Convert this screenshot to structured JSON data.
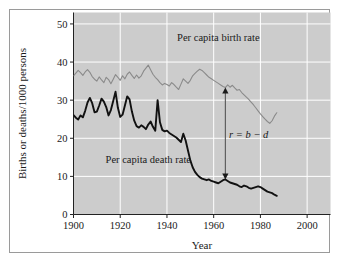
{
  "chart_data": {
    "type": "line",
    "title": "",
    "xlabel": "Year",
    "ylabel": "Births or deaths/1000 persons",
    "xlim": [
      1900,
      2010
    ],
    "ylim": [
      0,
      53
    ],
    "xticks": [
      1900,
      1920,
      1940,
      1960,
      1980,
      2000
    ],
    "xtick_labels": [
      "1900",
      "1920",
      "1940",
      "1960",
      "1980",
      "2000"
    ],
    "yticks": [
      0,
      10,
      20,
      30,
      40,
      50
    ],
    "ytick_labels": [
      "0",
      "10",
      "20",
      "30",
      "40",
      "50"
    ],
    "grid": true,
    "grid_color": "#ffffff",
    "plot_background": "#cccccc",
    "legend_position": "inline-annotation",
    "series": [
      {
        "name": "Per capita birth rate",
        "label": "Per capita birth rate",
        "color": "#8a8a8a",
        "line_width": 1.1,
        "x": [
          1900,
          1901,
          1902,
          1903,
          1904,
          1905,
          1906,
          1907,
          1908,
          1909,
          1910,
          1911,
          1912,
          1913,
          1914,
          1915,
          1916,
          1917,
          1918,
          1919,
          1920,
          1921,
          1922,
          1923,
          1924,
          1925,
          1926,
          1927,
          1928,
          1929,
          1930,
          1931,
          1932,
          1933,
          1934,
          1935,
          1936,
          1937,
          1938,
          1939,
          1940,
          1941,
          1942,
          1943,
          1944,
          1945,
          1946,
          1947,
          1948,
          1949,
          1950,
          1951,
          1952,
          1953,
          1954,
          1955,
          1956,
          1957,
          1958,
          1959,
          1960,
          1961,
          1962,
          1963,
          1964,
          1965,
          1966,
          1967,
          1968,
          1969,
          1970,
          1971,
          1972,
          1973,
          1974,
          1975,
          1976,
          1977,
          1978,
          1979,
          1980,
          1981,
          1982,
          1983,
          1984,
          1985,
          1986,
          1987
        ],
        "y": [
          36.4,
          37.1,
          37.8,
          37.2,
          36.5,
          37.4,
          38.0,
          37.3,
          36.2,
          35.5,
          35.0,
          36.1,
          35.3,
          34.6,
          36.0,
          35.4,
          34.3,
          35.5,
          36.7,
          36.0,
          35.2,
          36.4,
          35.6,
          36.8,
          37.4,
          36.5,
          35.7,
          36.6,
          35.8,
          36.4,
          37.6,
          38.4,
          39.2,
          38.0,
          36.8,
          36.0,
          35.4,
          34.6,
          34.0,
          34.4,
          34.1,
          33.7,
          34.6,
          34.1,
          33.4,
          32.8,
          34.2,
          35.6,
          35.0,
          34.4,
          35.2,
          36.4,
          37.0,
          37.6,
          38.1,
          37.8,
          37.2,
          36.6,
          36.0,
          35.6,
          35.2,
          34.8,
          34.4,
          34.0,
          33.6,
          33.3,
          34.0,
          33.4,
          33.9,
          33.2,
          32.6,
          32.8,
          32.0,
          31.4,
          30.8,
          30.2,
          29.5,
          28.8,
          28.0,
          27.2,
          26.4,
          25.7,
          25.0,
          24.4,
          23.9,
          24.6,
          25.8,
          26.7
        ]
      },
      {
        "name": "Per capita death rate",
        "label": "Per capita death rate",
        "color": "#111111",
        "line_width": 1.9,
        "x": [
          1900,
          1901,
          1902,
          1903,
          1904,
          1905,
          1906,
          1907,
          1908,
          1909,
          1910,
          1911,
          1912,
          1913,
          1914,
          1915,
          1916,
          1917,
          1918,
          1919,
          1920,
          1921,
          1922,
          1923,
          1924,
          1925,
          1926,
          1927,
          1928,
          1929,
          1930,
          1931,
          1932,
          1933,
          1934,
          1935,
          1936,
          1937,
          1938,
          1939,
          1940,
          1941,
          1942,
          1943,
          1944,
          1945,
          1946,
          1947,
          1948,
          1949,
          1950,
          1951,
          1952,
          1953,
          1954,
          1955,
          1956,
          1957,
          1958,
          1959,
          1960,
          1961,
          1962,
          1963,
          1964,
          1965,
          1966,
          1967,
          1968,
          1969,
          1970,
          1971,
          1972,
          1973,
          1974,
          1975,
          1976,
          1977,
          1978,
          1979,
          1980,
          1981,
          1982,
          1983,
          1984,
          1985,
          1986,
          1987
        ],
        "y": [
          26.1,
          25.4,
          24.9,
          26.0,
          25.5,
          27.2,
          29.4,
          30.6,
          29.2,
          26.8,
          27.0,
          28.6,
          30.4,
          29.6,
          28.2,
          26.0,
          27.4,
          29.8,
          32.2,
          28.0,
          25.6,
          26.2,
          28.6,
          31.0,
          30.2,
          27.0,
          24.6,
          23.2,
          22.8,
          23.4,
          23.0,
          22.4,
          23.6,
          24.4,
          23.0,
          22.0,
          30.0,
          24.2,
          22.2,
          21.8,
          22.0,
          21.4,
          21.0,
          20.6,
          20.2,
          19.6,
          19.0,
          21.2,
          19.4,
          16.8,
          14.2,
          12.4,
          11.2,
          10.4,
          9.8,
          9.4,
          9.2,
          9.0,
          9.2,
          8.8,
          8.6,
          8.4,
          8.2,
          8.6,
          9.0,
          9.2,
          8.8,
          8.4,
          8.2,
          8.0,
          7.8,
          7.4,
          7.2,
          7.6,
          7.4,
          7.0,
          6.8,
          7.0,
          7.2,
          7.4,
          7.2,
          6.8,
          6.4,
          6.0,
          5.8,
          5.6,
          5.2,
          4.9
        ]
      }
    ],
    "annotations": [
      {
        "name": "growth-rate-annotation",
        "text": "r = b − d",
        "text_x": 1975,
        "text_y": 20,
        "arrow_x": 1965,
        "arrow_y_top": 33.3,
        "arrow_y_bottom": 9.2,
        "style": "double-headed-arrow",
        "color": "#555555"
      }
    ],
    "series_label_positions": [
      {
        "series": "Per capita birth rate",
        "x": 1962,
        "y": 45.5
      },
      {
        "series": "Per capita death rate",
        "x": 1932,
        "y": 13.5
      }
    ]
  }
}
